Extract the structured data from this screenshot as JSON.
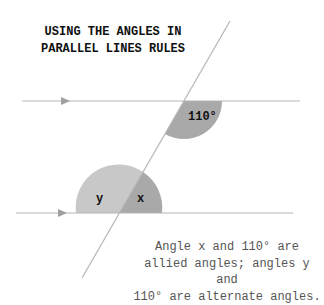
{
  "title": {
    "line1": "USING THE ANGLES IN",
    "line2": "PARALLEL LINES RULES"
  },
  "angles": {
    "top": "110°",
    "bottom_left": "y",
    "bottom_right": "x"
  },
  "caption": {
    "line1": "Angle x and 110° are",
    "line2": "allied angles; angles y and",
    "line3": "110° are alternate angles."
  },
  "colors": {
    "line": "#b5b5b5",
    "sector_light": "#c8c8c8",
    "sector_dark": "#a9a9a9",
    "text": "#111111",
    "caption": "#555555"
  }
}
